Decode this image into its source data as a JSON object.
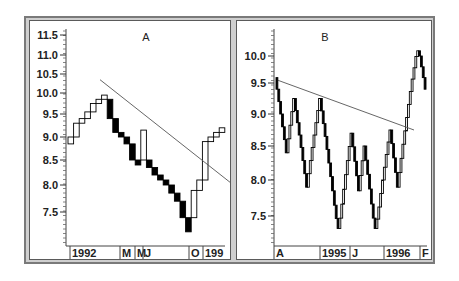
{
  "chart_data": [
    {
      "type": "point-and-figure-brick",
      "title": "A",
      "y_ticks": [
        11.5,
        11.0,
        10.5,
        10.0,
        9.5,
        9.0,
        8.5,
        8.0,
        7.5
      ],
      "y_tick_labels": [
        "11.5",
        "11.0",
        "10.5",
        "10.0",
        "9.5",
        "9.0",
        "8.5",
        "8.0",
        "7.5"
      ],
      "y_pixel_map": [
        [
          11.5,
          14
        ],
        [
          11.0,
          34
        ],
        [
          10.5,
          53
        ],
        [
          10.0,
          72
        ],
        [
          9.5,
          93
        ],
        [
          9.0,
          116
        ],
        [
          8.5,
          139
        ],
        [
          8.0,
          164
        ],
        [
          7.5,
          191
        ],
        [
          7.2,
          208
        ]
      ],
      "x_labels": [
        {
          "text": "1992",
          "x": 6
        },
        {
          "text": "M",
          "x": 56
        },
        {
          "text": "M",
          "x": 71
        },
        {
          "text": "J",
          "x": 79
        },
        {
          "text": "O",
          "x": 125
        },
        {
          "text": "199",
          "x": 139
        }
      ],
      "bricks": [
        {
          "x": 0,
          "top": 9.0,
          "bottom": 8.85,
          "up": true
        },
        {
          "x": 1,
          "top": 9.3,
          "bottom": 9.0,
          "up": true
        },
        {
          "x": 2,
          "top": 9.4,
          "bottom": 9.3,
          "up": true
        },
        {
          "x": 3,
          "top": 9.55,
          "bottom": 9.4,
          "up": true
        },
        {
          "x": 4,
          "top": 9.75,
          "bottom": 9.55,
          "up": true
        },
        {
          "x": 5,
          "top": 9.85,
          "bottom": 9.75,
          "up": true
        },
        {
          "x": 6,
          "top": 9.95,
          "bottom": 9.85,
          "up": true
        },
        {
          "x": 7,
          "top": 9.85,
          "bottom": 9.4,
          "up": false
        },
        {
          "x": 8,
          "top": 9.4,
          "bottom": 9.1,
          "up": false
        },
        {
          "x": 9,
          "top": 9.1,
          "bottom": 9.0,
          "up": false
        },
        {
          "x": 10,
          "top": 9.0,
          "bottom": 8.85,
          "up": false
        },
        {
          "x": 11,
          "top": 8.85,
          "bottom": 8.5,
          "up": false
        },
        {
          "x": 12,
          "top": 8.5,
          "bottom": 8.4,
          "up": false
        },
        {
          "x": 13,
          "top": 9.15,
          "bottom": 8.5,
          "up": true
        },
        {
          "x": 14,
          "top": 8.5,
          "bottom": 8.35,
          "up": false
        },
        {
          "x": 15,
          "top": 8.35,
          "bottom": 8.2,
          "up": false
        },
        {
          "x": 16,
          "top": 8.2,
          "bottom": 8.1,
          "up": false
        },
        {
          "x": 17,
          "top": 8.1,
          "bottom": 8.0,
          "up": false
        },
        {
          "x": 18,
          "top": 8.0,
          "bottom": 7.85,
          "up": false
        },
        {
          "x": 19,
          "top": 7.85,
          "bottom": 7.7,
          "up": false
        },
        {
          "x": 20,
          "top": 7.7,
          "bottom": 7.4,
          "up": false
        },
        {
          "x": 21,
          "top": 7.4,
          "bottom": 7.15,
          "up": false
        },
        {
          "x": 22,
          "top": 7.9,
          "bottom": 7.4,
          "up": true
        },
        {
          "x": 23,
          "top": 8.1,
          "bottom": 7.9,
          "up": true
        },
        {
          "x": 24,
          "top": 8.9,
          "bottom": 8.1,
          "up": true
        },
        {
          "x": 25,
          "top": 9.0,
          "bottom": 8.9,
          "up": true
        },
        {
          "x": 26,
          "top": 9.1,
          "bottom": 9.0,
          "up": true
        },
        {
          "x": 27,
          "top": 9.2,
          "bottom": 9.1,
          "up": true
        }
      ],
      "trendline": {
        "from": [
          34,
          10.35
        ],
        "to": [
          188,
          7.7
        ]
      }
    },
    {
      "type": "point-and-figure-brick",
      "title": "B",
      "y_ticks": [
        10.0,
        9.5,
        9.0,
        8.5,
        8.0,
        7.5
      ],
      "y_tick_labels": [
        "10.0",
        "9.5",
        "9.0",
        "8.5",
        "8.0",
        "7.5"
      ],
      "y_pixel_map": [
        [
          10.5,
          22
        ],
        [
          10.0,
          35
        ],
        [
          9.5,
          62
        ],
        [
          9.0,
          93
        ],
        [
          8.5,
          125
        ],
        [
          8.0,
          159
        ],
        [
          7.5,
          195
        ],
        [
          7.2,
          210
        ]
      ],
      "x_labels": [
        {
          "text": "A",
          "x": 2
        },
        {
          "text": "1995",
          "x": 48
        },
        {
          "text": "J",
          "x": 78
        },
        {
          "text": "1996",
          "x": 112
        },
        {
          "text": "F",
          "x": 148
        }
      ],
      "trendline": {
        "from": [
          4,
          9.55
        ],
        "to": [
          140,
          8.75
        ]
      }
    }
  ],
  "panels": {
    "a": {
      "title": "A"
    },
    "b": {
      "title": "B"
    }
  }
}
